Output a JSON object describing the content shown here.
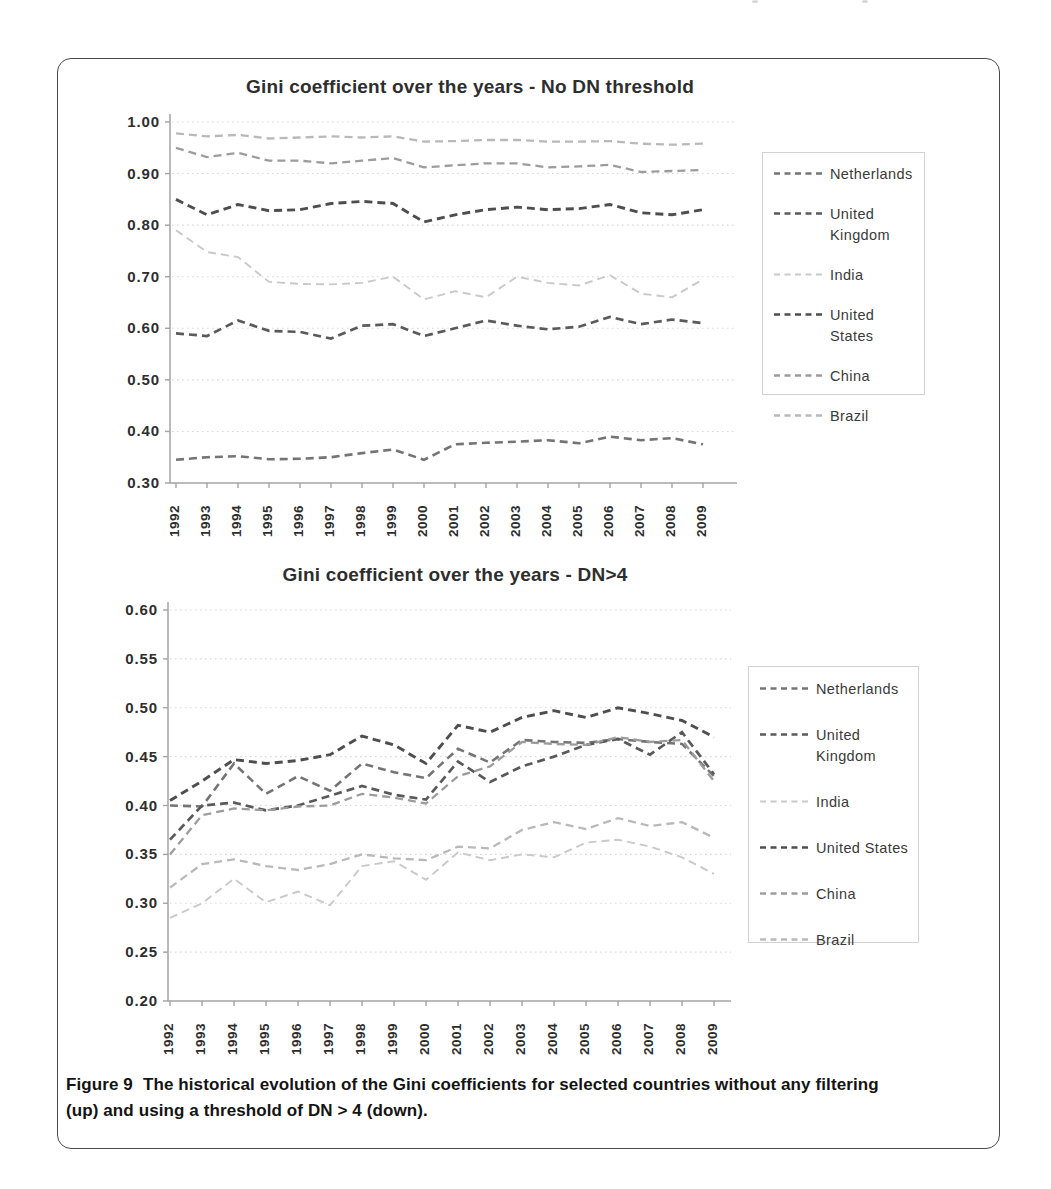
{
  "figure": {
    "caption_label": "Figure 9",
    "caption_body": "The historical evolution of the Gini coefficients for selected countries without any filtering (up) and using a threshold of DN > 4 (down)."
  },
  "legend_labels": [
    "Netherlands",
    "United Kingdom",
    "India",
    "United States",
    "China",
    "Brazil"
  ],
  "colors": {
    "Netherlands": "#747474",
    "United Kingdom": "#5a5a5a",
    "India": "#c9c9c9",
    "United States": "#4e4e4e",
    "China": "#9c9c9c",
    "Brazil": "#b9b9b9",
    "axis": "#a3a3a3",
    "grid": "#d9d9d9",
    "text": "#2f2f2f"
  },
  "chart_data": [
    {
      "type": "line",
      "title": "Gini coefficient over the years - No DN threshold",
      "xlabel": "",
      "ylabel": "",
      "line_style": "dashed",
      "grid": true,
      "legend_position": "right",
      "x": [
        "1992",
        "1993",
        "1994",
        "1995",
        "1996",
        "1997",
        "1998",
        "1999",
        "2000",
        "2001",
        "2002",
        "2003",
        "2004",
        "2005",
        "2006",
        "2007",
        "2008",
        "2009"
      ],
      "ylim": [
        0.3,
        1.0
      ],
      "ytick_labels": [
        "1.00",
        "0.90",
        "0.80",
        "0.70",
        "0.60",
        "0.50",
        "0.40",
        "0.30"
      ],
      "ytick_values": [
        1.0,
        0.9,
        0.8,
        0.7,
        0.6,
        0.5,
        0.4,
        0.3
      ],
      "series": [
        {
          "name": "Netherlands",
          "values": [
            0.345,
            0.35,
            0.352,
            0.346,
            0.347,
            0.35,
            0.358,
            0.365,
            0.345,
            0.375,
            0.378,
            0.38,
            0.383,
            0.377,
            0.39,
            0.383,
            0.387,
            0.375
          ]
        },
        {
          "name": "United Kingdom",
          "values": [
            0.59,
            0.585,
            0.615,
            0.595,
            0.593,
            0.58,
            0.605,
            0.608,
            0.585,
            0.6,
            0.615,
            0.605,
            0.598,
            0.603,
            0.622,
            0.608,
            0.617,
            0.61
          ]
        },
        {
          "name": "India",
          "values": [
            0.79,
            0.748,
            0.738,
            0.69,
            0.686,
            0.685,
            0.688,
            0.7,
            0.656,
            0.672,
            0.66,
            0.7,
            0.688,
            0.683,
            0.703,
            0.667,
            0.66,
            0.695
          ]
        },
        {
          "name": "United States",
          "values": [
            0.85,
            0.82,
            0.84,
            0.828,
            0.83,
            0.842,
            0.846,
            0.842,
            0.806,
            0.82,
            0.83,
            0.835,
            0.83,
            0.832,
            0.84,
            0.824,
            0.82,
            0.83
          ]
        },
        {
          "name": "China",
          "values": [
            0.95,
            0.932,
            0.94,
            0.925,
            0.925,
            0.92,
            0.925,
            0.93,
            0.912,
            0.916,
            0.92,
            0.92,
            0.912,
            0.914,
            0.917,
            0.903,
            0.905,
            0.907
          ]
        },
        {
          "name": "Brazil",
          "values": [
            0.978,
            0.972,
            0.975,
            0.968,
            0.97,
            0.972,
            0.97,
            0.972,
            0.962,
            0.963,
            0.965,
            0.965,
            0.962,
            0.962,
            0.963,
            0.958,
            0.956,
            0.958
          ]
        }
      ]
    },
    {
      "type": "line",
      "title": "Gini coefficient over the years - DN>4",
      "xlabel": "",
      "ylabel": "",
      "line_style": "dashed",
      "grid": true,
      "legend_position": "right",
      "x": [
        "1992",
        "1993",
        "1994",
        "1995",
        "1996",
        "1997",
        "1998",
        "1999",
        "2000",
        "2001",
        "2002",
        "2003",
        "2004",
        "2005",
        "2006",
        "2007",
        "2008",
        "2009"
      ],
      "ylim": [
        0.2,
        0.6
      ],
      "ytick_labels": [
        "0.60",
        "0.55",
        "0.50",
        "0.45",
        "0.40",
        "0.35",
        "0.30",
        "0.25",
        "0.20"
      ],
      "ytick_values": [
        0.6,
        0.55,
        0.5,
        0.45,
        0.4,
        0.35,
        0.3,
        0.25,
        0.2
      ],
      "series": [
        {
          "name": "Netherlands",
          "values": [
            0.4,
            0.399,
            0.443,
            0.412,
            0.43,
            0.415,
            0.443,
            0.434,
            0.428,
            0.458,
            0.444,
            0.467,
            0.465,
            0.464,
            0.468,
            0.465,
            0.463,
            0.43
          ]
        },
        {
          "name": "United Kingdom",
          "values": [
            0.365,
            0.4,
            0.403,
            0.395,
            0.4,
            0.41,
            0.42,
            0.411,
            0.406,
            0.445,
            0.424,
            0.44,
            0.45,
            0.462,
            0.468,
            0.452,
            0.475,
            0.432
          ]
        },
        {
          "name": "India",
          "values": [
            0.285,
            0.3,
            0.325,
            0.301,
            0.312,
            0.298,
            0.338,
            0.343,
            0.324,
            0.352,
            0.344,
            0.35,
            0.347,
            0.362,
            0.365,
            0.358,
            0.347,
            0.33
          ]
        },
        {
          "name": "United States",
          "values": [
            0.405,
            0.425,
            0.447,
            0.443,
            0.446,
            0.452,
            0.471,
            0.462,
            0.443,
            0.482,
            0.475,
            0.49,
            0.497,
            0.49,
            0.5,
            0.494,
            0.487,
            0.47
          ]
        },
        {
          "name": "China",
          "values": [
            0.35,
            0.39,
            0.397,
            0.395,
            0.399,
            0.4,
            0.412,
            0.408,
            0.402,
            0.43,
            0.44,
            0.465,
            0.463,
            0.462,
            0.47,
            0.465,
            0.467,
            0.425
          ]
        },
        {
          "name": "Brazil",
          "values": [
            0.316,
            0.34,
            0.345,
            0.338,
            0.334,
            0.34,
            0.35,
            0.346,
            0.344,
            0.358,
            0.356,
            0.375,
            0.383,
            0.376,
            0.387,
            0.379,
            0.383,
            0.367
          ]
        }
      ]
    }
  ]
}
